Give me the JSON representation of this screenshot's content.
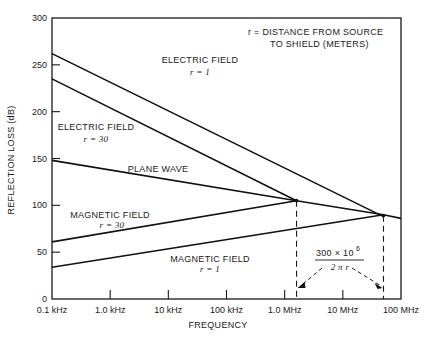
{
  "chart_data": {
    "type": "line",
    "title": "",
    "xlabel": "FREQUENCY",
    "ylabel": "REFLECTION LOSS (dB)",
    "xscale": "log",
    "xlim_hz": [
      100,
      100000000
    ],
    "ylim": [
      0,
      300
    ],
    "grid": false,
    "y_ticks": [
      0,
      50,
      100,
      150,
      200,
      250,
      300
    ],
    "y_tick_labels": [
      "0",
      "50",
      "100",
      "150",
      "200",
      "250",
      "300"
    ],
    "x_ticks_hz": [
      100,
      1000,
      10000,
      100000,
      1000000,
      10000000,
      100000000
    ],
    "x_tick_labels": [
      "0.1 kHz",
      "1.0 kHz",
      "10 kHz",
      "100 kHz",
      "1.0 MHz",
      "10 MHz",
      "100 MHz"
    ],
    "series": [
      {
        "name": "ELECTRIC FIELD r = 1",
        "label_line1": "ELECTRIC FIELD",
        "label_line2": "r = 1",
        "points": [
          [
            100,
            262
          ],
          [
            50000000,
            88
          ]
        ]
      },
      {
        "name": "ELECTRIC FIELD r = 30",
        "label_line1": "ELECTRIC FIELD",
        "label_line2": "r = 30",
        "points": [
          [
            100,
            235
          ],
          [
            1600000,
            105
          ]
        ]
      },
      {
        "name": "PLANE WAVE",
        "label_line1": "PLANE WAVE",
        "label_line2": "",
        "points": [
          [
            100,
            148
          ],
          [
            1600000,
            105
          ],
          [
            50000000,
            90
          ],
          [
            100000000,
            86
          ]
        ]
      },
      {
        "name": "MAGNETIC FIELD r = 30",
        "label_line1": "MAGNETIC FIELD",
        "label_line2": "r = 30",
        "points": [
          [
            100,
            61
          ],
          [
            1600000,
            105
          ]
        ]
      },
      {
        "name": "MAGNETIC FIELD r = 1",
        "label_line1": "MAGNETIC FIELD",
        "label_line2": "r = 1",
        "points": [
          [
            100,
            34
          ],
          [
            50000000,
            90
          ]
        ]
      }
    ],
    "crossovers_hz": [
      1600000,
      50000000
    ],
    "annotations": {
      "legend_note_line1": "r = DISTANCE FROM SOURCE",
      "legend_note_line2": "TO SHIELD (METERS)",
      "formula_numerator": "300 × 10",
      "formula_exponent": "6",
      "formula_denominator": "2 π r"
    }
  }
}
